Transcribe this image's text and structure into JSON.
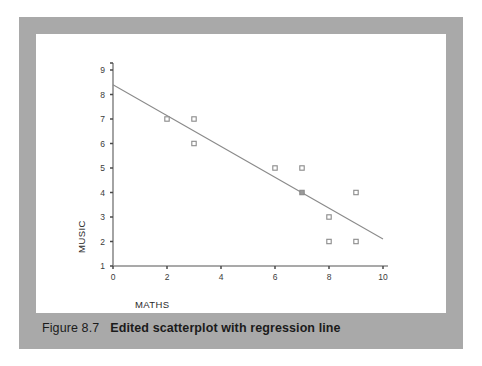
{
  "caption": {
    "figure_number": "Figure 8.7",
    "title": "Edited scatterplot with regression line"
  },
  "colors": {
    "frame": "#a9a9a9",
    "panel": "#ffffff",
    "axis": "#8d8d8d",
    "marker_stroke": "#8a8a8a",
    "regression_line": "#8a8a8a",
    "text": "#2a2a2a"
  },
  "chart_data": {
    "type": "scatter",
    "title": "",
    "xlabel": "MATHS",
    "ylabel": "MUSIC",
    "xlim": [
      0,
      10
    ],
    "ylim": [
      1,
      9
    ],
    "xticks": [
      0,
      2,
      4,
      6,
      8,
      10
    ],
    "xtick_labels": [
      "0",
      "2",
      "4",
      "6",
      "8",
      "10"
    ],
    "yticks": [
      1,
      2,
      3,
      4,
      5,
      6,
      7,
      8,
      9
    ],
    "ytick_labels": [
      "1",
      "2",
      "3",
      "4",
      "5",
      "6",
      "7",
      "8",
      "9"
    ],
    "grid": false,
    "legend": "none",
    "marker_style": "open-square",
    "points": [
      {
        "x": 2,
        "y": 7
      },
      {
        "x": 3,
        "y": 7
      },
      {
        "x": 3,
        "y": 6
      },
      {
        "x": 6,
        "y": 5
      },
      {
        "x": 7,
        "y": 5
      },
      {
        "x": 7,
        "y": 4,
        "on_line": true
      },
      {
        "x": 8,
        "y": 3
      },
      {
        "x": 8,
        "y": 2
      },
      {
        "x": 9,
        "y": 4
      },
      {
        "x": 9,
        "y": 2
      }
    ],
    "regression_line": {
      "x_start": 0,
      "y_start": 8.4,
      "x_end": 10,
      "y_end": 2.1
    }
  }
}
